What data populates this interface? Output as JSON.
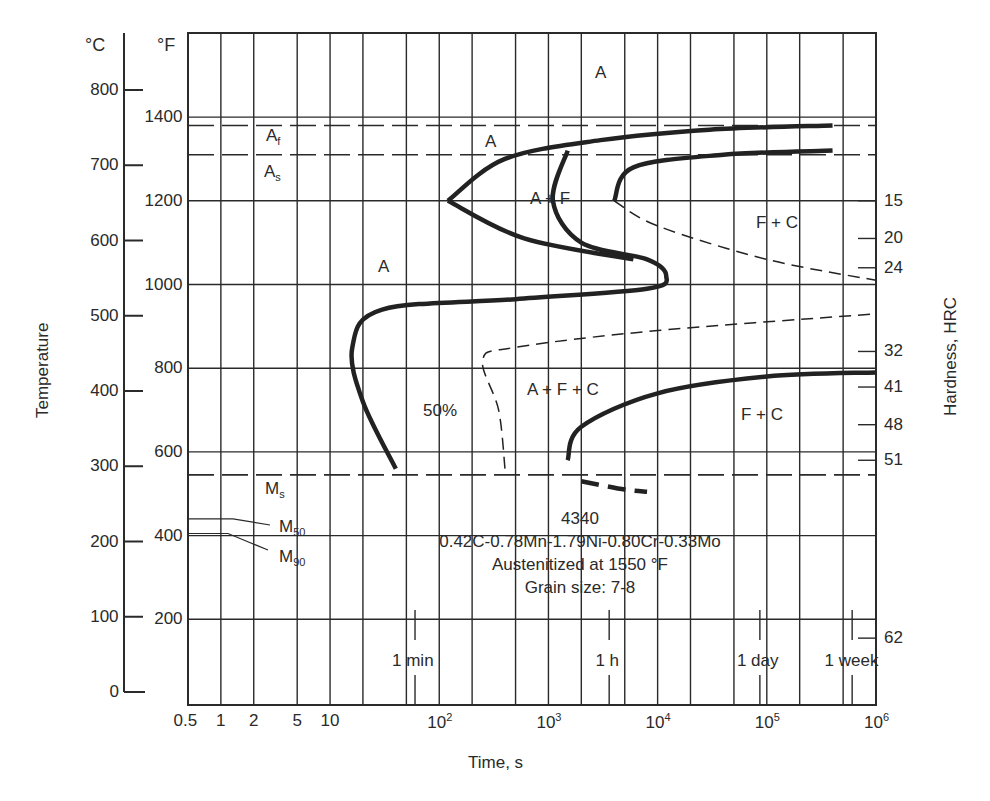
{
  "chart_data": {
    "type": "line",
    "title": "4340",
    "subtitle": [
      "0.42C-0.78Mn-1.79Ni-0.80Cr-0.33Mo",
      "Austenitized at 1550 °F",
      "Grain size: 7-8"
    ],
    "xlabel": "Time, s",
    "xscale": "log",
    "xlim": [
      0.5,
      1000000
    ],
    "x_tick_labels": [
      "0.5",
      "1",
      "2",
      "5",
      "10",
      "10^2",
      "10^3",
      "10^4",
      "10^5",
      "10^6"
    ],
    "x_tick_values": [
      0.5,
      1,
      2,
      5,
      10,
      100,
      1000,
      10000,
      100000,
      1000000
    ],
    "time_markers": [
      {
        "label": "1 min",
        "value": 60
      },
      {
        "label": "1 h",
        "value": 3600
      },
      {
        "label": "1 day",
        "value": 86400
      },
      {
        "label": "1 week",
        "value": 604800
      }
    ],
    "ylabel_left": "Temperature",
    "y_celsius_unit": "°C",
    "y_fahrenheit_unit": "°F",
    "y_celsius_ticks": [
      0,
      100,
      200,
      300,
      400,
      500,
      600,
      700,
      800
    ],
    "y_fahrenheit_ticks": [
      200,
      400,
      600,
      800,
      1000,
      1200,
      1400
    ],
    "ylim_fahrenheit": [
      0,
      1650
    ],
    "ylabel_right": "Hardness, HRC",
    "hardness_ticks": [
      {
        "hrc": "15",
        "temp_f": 1200
      },
      {
        "hrc": "20",
        "temp_f": 1110
      },
      {
        "hrc": "24",
        "temp_f": 1040
      },
      {
        "hrc": "32",
        "temp_f": 840
      },
      {
        "hrc": "41",
        "temp_f": 755
      },
      {
        "hrc": "48",
        "temp_f": 665
      },
      {
        "hrc": "51",
        "temp_f": 580
      },
      {
        "hrc": "62",
        "temp_f": 155
      }
    ],
    "reference_lines": [
      {
        "label": "Af",
        "temp_f": 1380,
        "style": "dashed"
      },
      {
        "label": "As",
        "temp_f": 1310,
        "style": "dashed"
      },
      {
        "label": "Ms",
        "temp_f": 545,
        "style": "dashed"
      },
      {
        "label": "M50",
        "temp_f": 440,
        "style": "solid"
      },
      {
        "label": "M90",
        "temp_f": 405,
        "style": "solid"
      }
    ],
    "regions": [
      "A",
      "A",
      "A",
      "A + F",
      "F + C",
      "A + F + C",
      "F + C"
    ],
    "annotations": [
      "50%"
    ],
    "series": [
      {
        "name": "Ferrite start (upper nose)",
        "style": "solid-thick",
        "points": [
          [
            120,
            1200
          ],
          [
            400,
            1300
          ],
          [
            3000,
            1345
          ],
          [
            30000,
            1370
          ],
          [
            400000,
            1380
          ]
        ]
      },
      {
        "name": "Ferrite start (lower)",
        "style": "solid-thick",
        "points": [
          [
            120,
            1200
          ],
          [
            600,
            1110
          ],
          [
            6000,
            1060
          ]
        ]
      },
      {
        "name": "Transformation start (pearlite)",
        "style": "solid-thick",
        "points": [
          [
            1500,
            1320
          ],
          [
            1100,
            1200
          ],
          [
            2000,
            1100
          ],
          [
            8000,
            1060
          ],
          [
            12000,
            1020
          ],
          [
            8000,
            990
          ],
          [
            500,
            965
          ],
          [
            30,
            940
          ],
          [
            16,
            850
          ],
          [
            20,
            720
          ],
          [
            40,
            560
          ]
        ]
      },
      {
        "name": "Transformation finish (pearlite)",
        "style": "solid-thick",
        "points": [
          [
            4000,
            1200
          ],
          [
            6000,
            1280
          ],
          [
            40000,
            1310
          ],
          [
            400000,
            1320
          ]
        ]
      },
      {
        "name": "50% transformed",
        "style": "dashed",
        "points": [
          [
            4000,
            1200
          ],
          [
            10000,
            1140
          ],
          [
            100000,
            1060
          ],
          [
            1000000,
            1010
          ]
        ]
      },
      {
        "name": "Bainite 50%",
        "style": "dashed",
        "points": [
          [
            400,
            560
          ],
          [
            350,
            700
          ],
          [
            250,
            820
          ],
          [
            500,
            850
          ],
          [
            10000,
            890
          ],
          [
            1000000,
            930
          ]
        ]
      },
      {
        "name": "Bainite start",
        "style": "solid-thick",
        "points": [
          [
            1500,
            580
          ],
          [
            2000,
            660
          ],
          [
            10000,
            740
          ],
          [
            100000,
            780
          ],
          [
            1000000,
            790
          ]
        ]
      },
      {
        "name": "Martensite region (dashed)",
        "style": "dashed-thick",
        "points": [
          [
            2000,
            530
          ],
          [
            5000,
            510
          ],
          [
            8000,
            505
          ]
        ]
      }
    ],
    "grid": true
  }
}
